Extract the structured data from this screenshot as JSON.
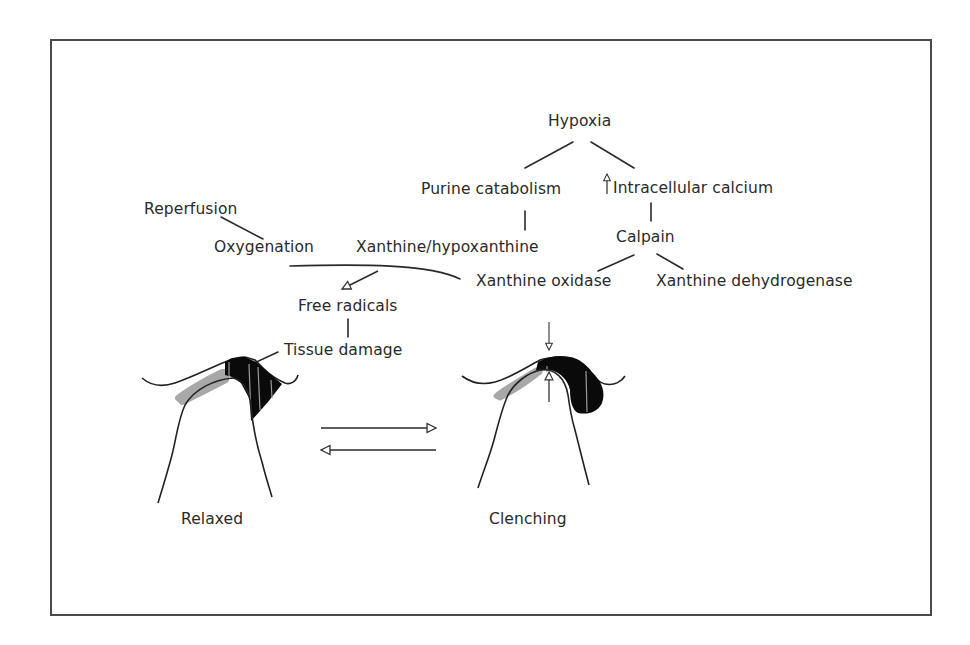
{
  "diagram": {
    "nodes": {
      "hypoxia": "Hypoxia",
      "purine_catabolism": "Purine catabolism",
      "intracellular_calcium": "Intracellular calcium",
      "reperfusion": "Reperfusion",
      "oxygenation": "Oxygenation",
      "xanthine_hypoxanthine": "Xanthine/hypoxanthine",
      "calpain": "Calpain",
      "xanthine_oxidase": "Xanthine oxidase",
      "xanthine_dehydrogenase": "Xanthine dehydrogenase",
      "free_radicals": "Free radicals",
      "tissue_damage": "Tissue damage"
    },
    "panels": {
      "relaxed": "Relaxed",
      "clenching": "Clenching"
    },
    "edges": [
      [
        "Hypoxia",
        "Purine catabolism"
      ],
      [
        "Hypoxia",
        "Intracellular calcium"
      ],
      [
        "Purine catabolism",
        "Xanthine/hypoxanthine"
      ],
      [
        "Intracellular calcium",
        "Calpain"
      ],
      [
        "Calpain",
        "Xanthine oxidase"
      ],
      [
        "Calpain",
        "Xanthine dehydrogenase"
      ],
      [
        "Reperfusion",
        "Oxygenation"
      ],
      [
        "Oxygenation + Xanthine oxidase",
        "Free radicals"
      ],
      [
        "Free radicals",
        "Tissue damage"
      ],
      [
        "Tissue damage",
        "Relaxed joint"
      ]
    ],
    "increase_marker": "up-arrow (increased)",
    "colors": {
      "line": "#2a2a2a",
      "tissue_dark": "#0a0a0a",
      "cartilage_gray": "#a8a8a8",
      "frame": "#4a4a4a"
    }
  }
}
